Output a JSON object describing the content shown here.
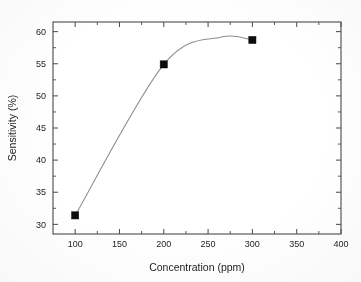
{
  "chart_data": {
    "type": "scatter",
    "title": "",
    "subtitle": "",
    "xlabel": "Concentration (ppm)",
    "ylabel": "Sensitivity (%)",
    "xlim": [
      75,
      400
    ],
    "ylim": [
      28.5,
      61.5
    ],
    "xticks": [
      100,
      150,
      200,
      250,
      300,
      350,
      400
    ],
    "xtick_labels": [
      "100",
      "150",
      "200",
      "250",
      "300",
      "350",
      "400"
    ],
    "yticks": [
      30,
      35,
      40,
      45,
      50,
      55,
      60
    ],
    "ytick_labels": [
      "30",
      "35",
      "40",
      "45",
      "50",
      "55",
      "60"
    ],
    "x_minor_tick_step": 25,
    "y_minor_tick_step": 2.5,
    "grid": false,
    "legend": false,
    "legend_position": "none",
    "tick_direction": "in",
    "frame": "box",
    "x": [
      100,
      200,
      300
    ],
    "values": [
      31.4,
      54.9,
      58.7
    ],
    "series": [
      {
        "name": "Sensitivity",
        "marker": "filled-square",
        "marker_color": "#0d0d0d",
        "line_color": "#8d8d8d",
        "line_style": "smooth-spline",
        "points": [
          {
            "x": 100,
            "y": 31.4
          },
          {
            "x": 200,
            "y": 54.9
          },
          {
            "x": 300,
            "y": 58.7
          }
        ]
      }
    ],
    "annotations": [],
    "colors": {
      "marker": "#0d0d0d",
      "line": "#8d8d8d",
      "axis": "#4a4a4a",
      "text": "#1d1d1d",
      "background": "#fefefe"
    }
  },
  "axes": {
    "x_title": "Concentration (ppm)",
    "y_title": "Sensitivity (%)"
  },
  "ticks": {
    "x": [
      "100",
      "150",
      "200",
      "250",
      "300",
      "350",
      "400"
    ],
    "y": [
      "30",
      "35",
      "40",
      "45",
      "50",
      "55",
      "60"
    ]
  }
}
